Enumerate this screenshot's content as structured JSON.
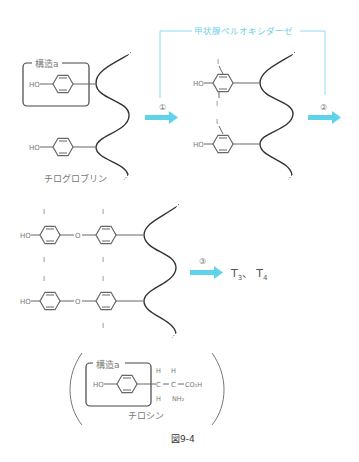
{
  "enzyme_label": "甲状腺ペルオキシダーゼ",
  "structure_label": "構造a",
  "thyroglobulin_label": "チログロブリン",
  "tyrosine_label": "チロシン",
  "figure_caption": "図9-4",
  "steps": [
    "①",
    "②",
    "③"
  ],
  "products": {
    "t3": "T",
    "t3_sub": "3",
    "sep": "、",
    "t4": "T",
    "t4_sub": "4"
  },
  "atoms": {
    "ho": "HO",
    "i": "I",
    "o": "O",
    "h": "H",
    "c": "C",
    "co2h": "CO₂H",
    "nh2": "NH₂"
  },
  "colors": {
    "arrow": "#5fd3ea",
    "enzyme_line": "#8adcec",
    "line": "#555555",
    "chain": "#333333"
  }
}
